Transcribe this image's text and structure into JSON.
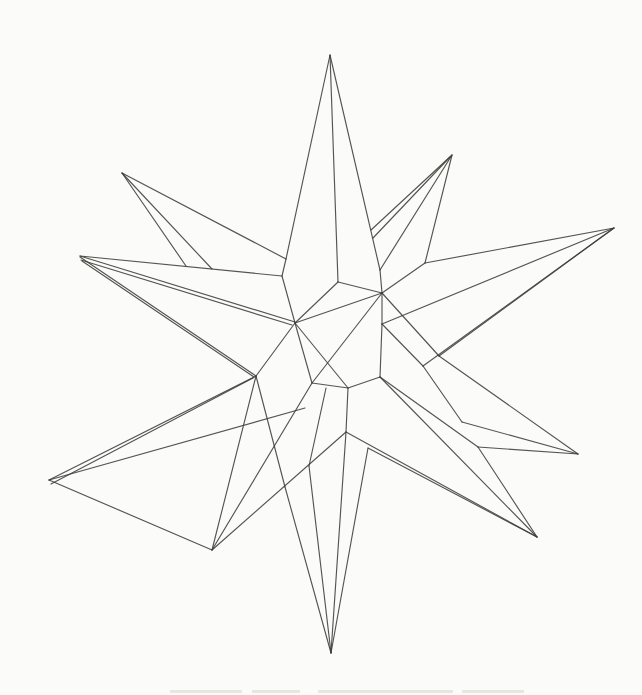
{
  "canvas": {
    "width": 642,
    "height": 695,
    "background": "#fbfbf9"
  },
  "figure": {
    "stroke_color": "#3e3e38",
    "stroke_width": 1.15,
    "stroke_opacity": 0.88,
    "vertices": {
      "aTop": [
        330,
        55
      ],
      "aUL": [
        122,
        173
      ],
      "aLeft": [
        80,
        256
      ],
      "aLLow": [
        49,
        480
      ],
      "aBL": [
        212,
        550
      ],
      "aBot": [
        331,
        653
      ],
      "aBR": [
        537,
        537
      ],
      "aRLow": [
        578,
        454
      ],
      "aRight": [
        614,
        228
      ],
      "aSlv": [
        452,
        155
      ],
      "B": [
        286,
        259
      ],
      "S1": [
        282,
        276
      ],
      "S7": [
        212,
        269
      ],
      "S7a": [
        186,
        266
      ],
      "S3": [
        380,
        270
      ],
      "S4": [
        425,
        263
      ],
      "P1": [
        382,
        293
      ],
      "P2": [
        338,
        282
      ],
      "P3": [
        295,
        323
      ],
      "P4": [
        312,
        383
      ],
      "P5": [
        348,
        388
      ],
      "P6": [
        380,
        377
      ],
      "V": [
        382,
        324
      ],
      "N": [
        256,
        376
      ],
      "K": [
        439,
        356
      ],
      "L": [
        423,
        366
      ],
      "T": [
        462,
        422
      ],
      "U": [
        478,
        447
      ],
      "R": [
        346,
        432
      ],
      "Q1": [
        285,
        487
      ],
      "Q2": [
        309,
        466
      ],
      "Q3": [
        368,
        448
      ],
      "W": [
        305,
        408
      ],
      "G1": [
        326,
        388
      ],
      "O1": [
        371,
        230
      ]
    },
    "edges": [
      [
        "aTop",
        "B"
      ],
      [
        "aTop",
        "P2"
      ],
      [
        "aTop",
        "S3"
      ],
      [
        "aUL",
        "B"
      ],
      [
        "aUL",
        "S7"
      ],
      [
        "aUL",
        "S7a"
      ],
      [
        "B",
        "S1"
      ],
      [
        "S1",
        "P3"
      ],
      [
        "aLeft",
        "S1"
      ],
      [
        "aSlv",
        "S3"
      ],
      [
        "aSlv",
        "S4"
      ],
      [
        "aSlv",
        "O1"
      ],
      [
        "S4",
        "aRight"
      ],
      [
        "aRight",
        "V"
      ],
      [
        "aRight",
        "L"
      ],
      [
        "aRight",
        "K"
      ],
      [
        "S3",
        "P1"
      ],
      [
        "S4",
        "P1"
      ],
      [
        "P1",
        "P2"
      ],
      [
        "P2",
        "P3"
      ],
      [
        "P3",
        "P4"
      ],
      [
        "P4",
        "P5"
      ],
      [
        "P5",
        "P6"
      ],
      [
        "P6",
        "V"
      ],
      [
        "V",
        "P1"
      ],
      [
        "P3",
        "P1"
      ],
      [
        "P1",
        "P4"
      ],
      [
        "P3",
        "P5"
      ],
      [
        "P1",
        "K"
      ],
      [
        "V",
        "L"
      ],
      [
        "K",
        "aRLow"
      ],
      [
        "L",
        "T"
      ],
      [
        "T",
        "aRLow"
      ],
      [
        "U",
        "aRLow"
      ],
      [
        "P6",
        "U"
      ],
      [
        "U",
        "aBR"
      ],
      [
        "P6",
        "aBR"
      ],
      [
        "R",
        "aBR"
      ],
      [
        "Q3",
        "aBR"
      ],
      [
        "aBot",
        "R"
      ],
      [
        "aBot",
        "Q3"
      ],
      [
        "aBot",
        "Q1"
      ],
      [
        "aBot",
        "Q2"
      ],
      [
        "Q2",
        "G1"
      ],
      [
        "Q1",
        "N"
      ],
      [
        "R",
        "P5"
      ],
      [
        "aLLow",
        "W"
      ],
      [
        "aLLow",
        "aBL"
      ],
      [
        "aBL",
        "N"
      ],
      [
        "aBL",
        "P4"
      ],
      [
        "aBL",
        "R"
      ],
      [
        "N",
        "P3"
      ]
    ],
    "extra_lines": [
      [
        450,
        157,
        373,
        238
      ],
      [
        80,
        256,
        295,
        322
      ],
      [
        81,
        260,
        292,
        325
      ],
      [
        80,
        257,
        256,
        376
      ],
      [
        82,
        261,
        254,
        377
      ],
      [
        49,
        480,
        256,
        376
      ],
      [
        51,
        484,
        253,
        378
      ]
    ],
    "caption_fragments": {
      "color": "#d9d5cc",
      "opacity": 0.55,
      "height": 3,
      "y": 690,
      "marks": [
        {
          "x": 170,
          "w": 72
        },
        {
          "x": 252,
          "w": 48
        },
        {
          "x": 318,
          "w": 135
        },
        {
          "x": 462,
          "w": 62
        }
      ]
    }
  }
}
